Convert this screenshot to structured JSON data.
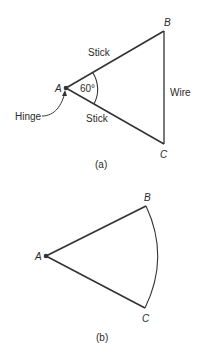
{
  "figure_a": {
    "caption": "(a)",
    "points": {
      "A": {
        "label": "A",
        "x": 66,
        "y": 88
      },
      "B": {
        "label": "B",
        "x": 164,
        "y": 31
      },
      "C": {
        "label": "C",
        "x": 164,
        "y": 144
      }
    },
    "labels": {
      "stick_top": "Stick",
      "stick_bottom": "Stick",
      "wire": "Wire",
      "angle": "60°",
      "hinge": "Hinge"
    }
  },
  "figure_b": {
    "caption": "(b)",
    "points": {
      "A": {
        "label": "A",
        "x": 46,
        "y": 256
      },
      "B": {
        "label": "B",
        "x": 146,
        "y": 206
      },
      "C": {
        "label": "C",
        "x": 145,
        "y": 308
      }
    }
  },
  "colors": {
    "stroke": "#333333",
    "text": "#2a2a2a"
  }
}
